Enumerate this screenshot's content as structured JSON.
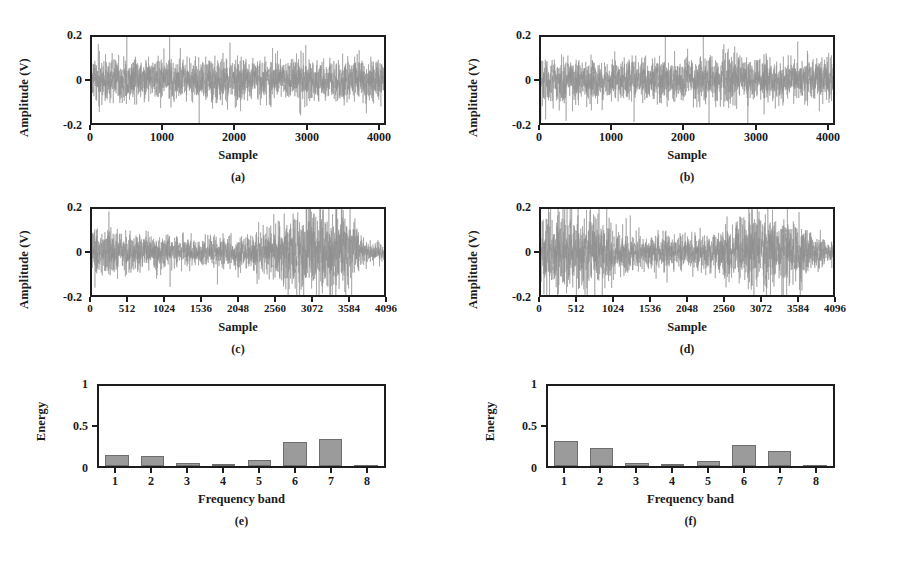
{
  "figure": {
    "background": "#ffffff",
    "trace_color": "#8f8f8f",
    "bar_color": "#9b9b9b",
    "bar_edge_color": "#6e6e6e",
    "axis_color": "#1d1d1d"
  },
  "panels": [
    {
      "id": "a",
      "caption": "(a)",
      "ylabel": "Amplitude (V)",
      "xlabel": "Sample",
      "yticks": [
        "0.2",
        "0",
        "-0.2"
      ],
      "xticks": [
        "0",
        "1000",
        "2000",
        "3000",
        "4000"
      ]
    },
    {
      "id": "b",
      "caption": "(b)",
      "ylabel": "Amplitude (V)",
      "xlabel": "Sample",
      "yticks": [
        "0.2",
        "0",
        "-0.2"
      ],
      "xticks": [
        "0",
        "1000",
        "2000",
        "3000",
        "4000"
      ]
    },
    {
      "id": "c",
      "caption": "(c)",
      "ylabel": "Amplitude (V)",
      "xlabel": "Sample",
      "yticks": [
        "0.2",
        "0",
        "-0.2"
      ],
      "xticks": [
        "0",
        "512",
        "1024",
        "1536",
        "2048",
        "2560",
        "3072",
        "3584",
        "4096"
      ]
    },
    {
      "id": "d",
      "caption": "(d)",
      "ylabel": "Amplitude (V)",
      "xlabel": "Sample",
      "yticks": [
        "0.2",
        "0",
        "-0.2"
      ],
      "xticks": [
        "0",
        "512",
        "1024",
        "1536",
        "2048",
        "2560",
        "3072",
        "3584",
        "4096"
      ]
    },
    {
      "id": "e",
      "caption": "(e)",
      "ylabel": "Energy",
      "xlabel": "Frequency band",
      "yticks": [
        "1",
        "0.5",
        "0"
      ],
      "xticks": [
        "1",
        "2",
        "3",
        "4",
        "5",
        "6",
        "7",
        "8"
      ]
    },
    {
      "id": "f",
      "caption": "(f)",
      "ylabel": "Energy",
      "xlabel": "Frequency band",
      "yticks": [
        "1",
        "0.5",
        "0"
      ],
      "xticks": [
        "1",
        "2",
        "3",
        "4",
        "5",
        "6",
        "7",
        "8"
      ]
    }
  ],
  "chart_data": [
    {
      "panel": "a",
      "type": "line",
      "title": "(a)",
      "xlabel": "Sample",
      "ylabel": "Amplitude (V)",
      "xlim": [
        0,
        4096
      ],
      "ylim": [
        -0.2,
        0.2
      ],
      "xticks": [
        0,
        1000,
        2000,
        3000,
        4000
      ],
      "yticks": [
        -0.2,
        0,
        0.2
      ],
      "grid": false,
      "legend": "none",
      "description": "Stationary broadband noise signal, roughly uniform envelope",
      "envelope_x": [
        0,
        512,
        1024,
        1536,
        2048,
        2560,
        3072,
        3584,
        4096
      ],
      "envelope_amplitude": [
        0.105,
        0.11,
        0.1,
        0.105,
        0.11,
        0.1,
        0.105,
        0.11,
        0.1
      ],
      "peak_amplitude": 0.19,
      "rms_amplitude": 0.05,
      "seed": 11
    },
    {
      "panel": "b",
      "type": "line",
      "title": "(b)",
      "xlabel": "Sample",
      "ylabel": "Amplitude (V)",
      "xlim": [
        0,
        4096
      ],
      "ylim": [
        -0.2,
        0.2
      ],
      "xticks": [
        0,
        1000,
        2000,
        3000,
        4000
      ],
      "yticks": [
        -0.2,
        0,
        0.2
      ],
      "grid": false,
      "legend": "none",
      "description": "Stationary broadband noise signal, roughly uniform envelope",
      "envelope_x": [
        0,
        512,
        1024,
        1536,
        2048,
        2560,
        3072,
        3584,
        4096
      ],
      "envelope_amplitude": [
        0.11,
        0.105,
        0.1,
        0.105,
        0.1,
        0.115,
        0.1,
        0.105,
        0.11
      ],
      "peak_amplitude": 0.2,
      "rms_amplitude": 0.05,
      "seed": 29
    },
    {
      "panel": "c",
      "type": "line",
      "title": "(c)",
      "xlabel": "Sample",
      "ylabel": "Amplitude (V)",
      "xlim": [
        0,
        4096
      ],
      "ylim": [
        -0.2,
        0.2
      ],
      "xticks": [
        0,
        512,
        1024,
        1536,
        2048,
        2560,
        3072,
        3584,
        4096
      ],
      "yticks": [
        -0.2,
        0,
        0.2
      ],
      "grid": false,
      "legend": "none",
      "description": "Non-stationary signal: moderate start, quiet middle, strong impulsive burst between 2560 and 3584, then decays",
      "envelope_x": [
        0,
        512,
        1024,
        1536,
        2048,
        2304,
        2560,
        2816,
        3072,
        3328,
        3584,
        3840,
        4096
      ],
      "envelope_amplitude": [
        0.105,
        0.1,
        0.085,
        0.07,
        0.075,
        0.1,
        0.12,
        0.185,
        0.2,
        0.195,
        0.2,
        0.05,
        0.045
      ],
      "peak_amplitude": 0.2,
      "rms_amplitude": 0.055,
      "burst_region": [
        2560,
        3584
      ],
      "seed": 47
    },
    {
      "panel": "d",
      "type": "line",
      "title": "(d)",
      "xlabel": "Sample",
      "ylabel": "Amplitude (V)",
      "xlim": [
        0,
        4096
      ],
      "ylim": [
        -0.2,
        0.2
      ],
      "xticks": [
        0,
        512,
        1024,
        1536,
        2048,
        2560,
        3072,
        3584,
        4096
      ],
      "yticks": [
        -0.2,
        0,
        0.2
      ],
      "grid": false,
      "legend": "none",
      "description": "Non-stationary signal: strong burst at the beginning up to 1024, quiet middle, second strong burst between 2560 and 3584, decaying tail",
      "envelope_x": [
        0,
        256,
        512,
        768,
        1024,
        1280,
        1536,
        1792,
        2048,
        2304,
        2560,
        2816,
        3072,
        3328,
        3584,
        3840,
        4096
      ],
      "envelope_amplitude": [
        0.19,
        0.2,
        0.185,
        0.19,
        0.12,
        0.09,
        0.085,
        0.08,
        0.08,
        0.09,
        0.095,
        0.185,
        0.19,
        0.175,
        0.175,
        0.09,
        0.05
      ],
      "peak_amplitude": 0.2,
      "rms_amplitude": 0.06,
      "burst_region": [
        2560,
        3584
      ],
      "seed": 73
    },
    {
      "panel": "e",
      "type": "bar",
      "title": "(e)",
      "xlabel": "Frequency band",
      "ylabel": "Energy",
      "categories": [
        "1",
        "2",
        "3",
        "4",
        "5",
        "6",
        "7",
        "8"
      ],
      "values": [
        0.14,
        0.12,
        0.04,
        0.02,
        0.08,
        0.3,
        0.34,
        0.01
      ],
      "ylim": [
        0,
        1
      ],
      "yticks": [
        0,
        0.5,
        1
      ],
      "grid": false,
      "legend": "none"
    },
    {
      "panel": "f",
      "type": "bar",
      "title": "(f)",
      "xlabel": "Frequency band",
      "ylabel": "Energy",
      "categories": [
        "1",
        "2",
        "3",
        "4",
        "5",
        "6",
        "7",
        "8"
      ],
      "values": [
        0.31,
        0.22,
        0.04,
        0.025,
        0.06,
        0.26,
        0.19,
        0.012
      ],
      "ylim": [
        0,
        1
      ],
      "yticks": [
        0,
        0.5,
        1
      ],
      "grid": false,
      "legend": "none"
    }
  ]
}
